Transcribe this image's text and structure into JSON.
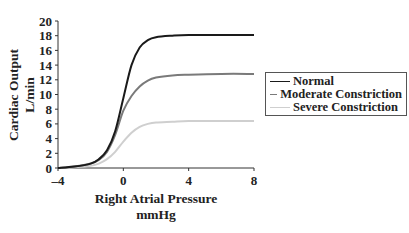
{
  "chart_data": {
    "type": "line",
    "title": "",
    "xlabel": "Right Atrial Pressure",
    "xlabel_unit": "mmHg",
    "ylabel": "Cardiac Output",
    "ylabel_unit": "L/min",
    "xlim": [
      -4,
      8
    ],
    "ylim": [
      0,
      20
    ],
    "x_ticks": [
      "-4",
      "0",
      "4",
      "8"
    ],
    "y_ticks": [
      "0",
      "2",
      "4",
      "6",
      "8",
      "10",
      "12",
      "14",
      "16",
      "18",
      "20"
    ],
    "grid": false,
    "legend_position": "right",
    "x": [
      -4,
      -3,
      -2,
      -1.5,
      -1,
      -0.5,
      0,
      0.5,
      1,
      1.5,
      2,
      3,
      4,
      6,
      8
    ],
    "series": [
      {
        "name": "Normal",
        "color": "#1a1a1a",
        "values": [
          0,
          0.2,
          0.6,
          1.2,
          2.4,
          5.0,
          9.5,
          14.0,
          16.4,
          17.4,
          17.8,
          18.0,
          18.1,
          18.1,
          18.1
        ]
      },
      {
        "name": "Moderate Constriction",
        "color": "#7a7a7a",
        "values": [
          0,
          0.2,
          0.6,
          1.1,
          2.2,
          4.5,
          7.8,
          9.8,
          11.1,
          11.9,
          12.3,
          12.6,
          12.7,
          12.8,
          12.8
        ]
      },
      {
        "name": "Severe Constriction",
        "color": "#cfcfcf",
        "values": [
          0,
          0.1,
          0.3,
          0.6,
          1.2,
          2.2,
          3.6,
          4.8,
          5.6,
          6.0,
          6.2,
          6.3,
          6.4,
          6.4,
          6.4
        ]
      }
    ]
  },
  "legend": {
    "items": [
      {
        "label": "Normal"
      },
      {
        "label": "Moderate Constriction"
      },
      {
        "label": "Severe Constriction"
      }
    ]
  },
  "axes": {
    "x_title": "Right Atrial Pressure",
    "x_unit": "mmHg",
    "y_title": "Cardiac Output",
    "y_unit": "L/min"
  }
}
